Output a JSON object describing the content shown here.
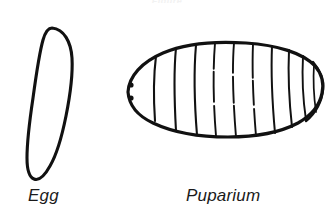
{
  "figure": {
    "name": "insect-life-stages-figure",
    "background_color": "#ffffff",
    "ink_color": "#111111",
    "cropped_top_caption": "Figure",
    "stages": [
      {
        "id": "egg",
        "label": "Egg",
        "shape": "elongated-oval",
        "description": "Elongated tilted oval outline, rounded broad top, tapering narrow lower end",
        "label_x": 28,
        "label_y": 186
      },
      {
        "id": "puparium",
        "label": "Puparium",
        "shape": "segmented-barrel",
        "description": "Barrel-shaped segmented outline tapering to a rounded anterior end bearing two spiracle dots, with a small posterior notch",
        "segment_line_count": 10,
        "spiracle_dot_count": 2,
        "label_x": 186,
        "label_y": 186
      }
    ]
  }
}
